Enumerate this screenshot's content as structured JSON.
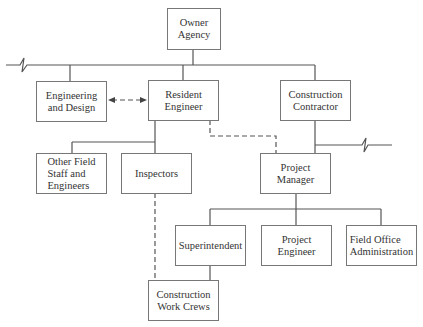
{
  "diagram": {
    "type": "organization-chart",
    "nodes": [
      {
        "id": "owner",
        "label": "Owner\nAgency"
      },
      {
        "id": "engdesign",
        "label": "Engineering\nand Design"
      },
      {
        "id": "resident",
        "label": "Resident\nEngineer"
      },
      {
        "id": "contractor",
        "label": "Construction\nContractor"
      },
      {
        "id": "otherfield",
        "label": "Other Field\nStaff and\nEngineers"
      },
      {
        "id": "inspectors",
        "label": "Inspectors"
      },
      {
        "id": "pm",
        "label": "Project\nManager"
      },
      {
        "id": "super",
        "label": "Superintendent"
      },
      {
        "id": "projeng",
        "label": "Project\nEngineer"
      },
      {
        "id": "fieldoffice",
        "label": "Field Office\nAdministration"
      },
      {
        "id": "crews",
        "label": "Construction\nWork Crews"
      }
    ],
    "edges": [
      {
        "from": "owner",
        "to": "engdesign",
        "style": "solid"
      },
      {
        "from": "owner",
        "to": "resident",
        "style": "solid"
      },
      {
        "from": "owner",
        "to": "contractor",
        "style": "solid"
      },
      {
        "from": "engdesign",
        "to": "resident",
        "style": "dashed",
        "arrows": "both"
      },
      {
        "from": "resident",
        "to": "otherfield",
        "style": "solid"
      },
      {
        "from": "resident",
        "to": "inspectors",
        "style": "solid"
      },
      {
        "from": "resident",
        "to": "pm",
        "style": "dashed"
      },
      {
        "from": "contractor",
        "to": "pm",
        "style": "solid"
      },
      {
        "from": "pm",
        "to": "super",
        "style": "solid"
      },
      {
        "from": "pm",
        "to": "projeng",
        "style": "solid"
      },
      {
        "from": "pm",
        "to": "fieldoffice",
        "style": "solid"
      },
      {
        "from": "inspectors",
        "to": "crews",
        "style": "dashed"
      },
      {
        "from": "super",
        "to": "crews",
        "style": "solid"
      }
    ]
  }
}
